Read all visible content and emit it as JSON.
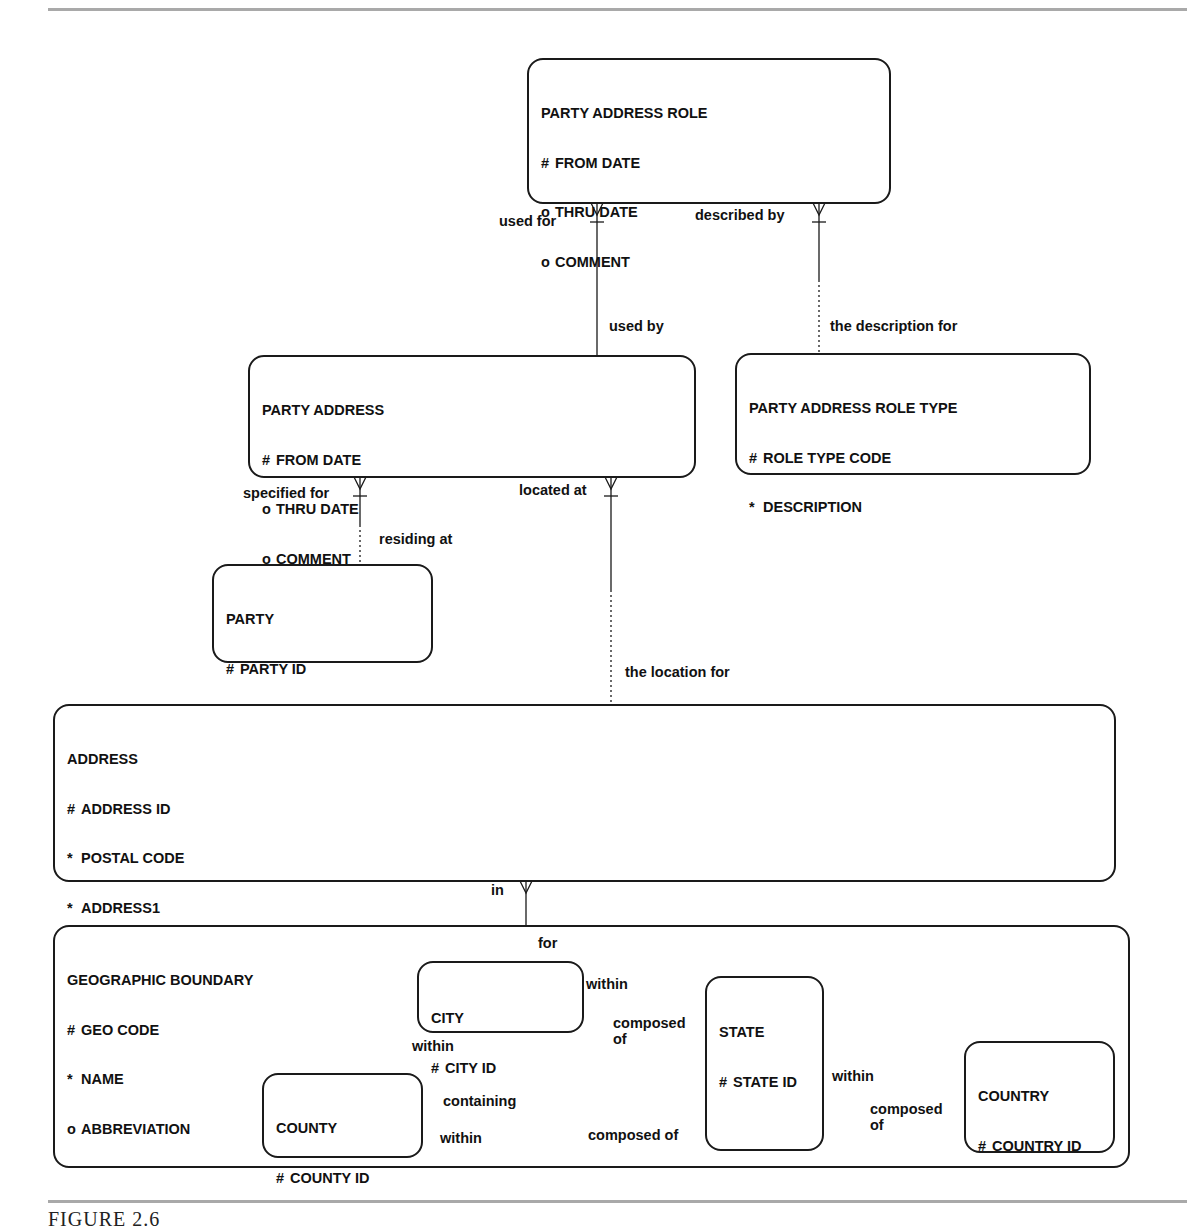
{
  "figure": {
    "caption": "FIGURE 2.6",
    "line_color": "#1a1a1a",
    "rule_color": "#a9a9a9"
  },
  "entities": {
    "party_address_role": {
      "name": "PARTY ADDRESS ROLE",
      "attributes": [
        {
          "symbol": "#",
          "label": "FROM DATE"
        },
        {
          "symbol": "o",
          "label": "THRU DATE"
        },
        {
          "symbol": "o",
          "label": "COMMENT"
        }
      ]
    },
    "party_address": {
      "name": "PARTY ADDRESS",
      "attributes": [
        {
          "symbol": "#",
          "label": "FROM DATE"
        },
        {
          "symbol": "o",
          "label": "THRU DATE"
        },
        {
          "symbol": "o",
          "label": "COMMENT"
        }
      ]
    },
    "party_address_role_type": {
      "name": "PARTY ADDRESS ROLE TYPE",
      "attributes": [
        {
          "symbol": "#",
          "label": "ROLE TYPE CODE"
        },
        {
          "symbol": "*",
          "label": "DESCRIPTION"
        }
      ]
    },
    "party": {
      "name": "PARTY",
      "attributes": [
        {
          "symbol": "#",
          "label": "PARTY ID"
        },
        {
          "symbol": "o",
          "label": "CREDIT RATING"
        }
      ]
    },
    "address": {
      "name": "ADDRESS",
      "attributes": [
        {
          "symbol": "#",
          "label": "ADDRESS ID"
        },
        {
          "symbol": "*",
          "label": "POSTAL CODE"
        },
        {
          "symbol": "*",
          "label": "ADDRESS1"
        },
        {
          "symbol": "o",
          "label": "ADDRESS2"
        },
        {
          "symbol": "o",
          "label": "DIRECTIONS"
        }
      ]
    },
    "geographic_boundary": {
      "name": "GEOGRAPHIC BOUNDARY",
      "attributes": [
        {
          "symbol": "#",
          "label": "GEO CODE"
        },
        {
          "symbol": "*",
          "label": "NAME"
        },
        {
          "symbol": "o",
          "label": "ABBREVIATION"
        }
      ]
    },
    "city": {
      "name": "CITY",
      "attributes": [
        {
          "symbol": "#",
          "label": "CITY ID"
        }
      ]
    },
    "state": {
      "name": "STATE",
      "attributes": [
        {
          "symbol": "#",
          "label": "STATE ID"
        }
      ]
    },
    "county": {
      "name": "COUNTY",
      "attributes": [
        {
          "symbol": "#",
          "label": "COUNTY ID"
        }
      ]
    },
    "country": {
      "name": "COUNTRY",
      "attributes": [
        {
          "symbol": "#",
          "label": "COUNTRY ID"
        }
      ]
    }
  },
  "relationships": {
    "role_party_address": {
      "from_label": "used for",
      "to_label": "used by"
    },
    "role_role_type": {
      "from_label": "described by",
      "to_label": "the description for"
    },
    "party_address_party": {
      "from_label": "specified for",
      "to_label": "residing at"
    },
    "party_address_address": {
      "from_label": "located at",
      "to_label": "the location for"
    },
    "address_geo": {
      "from_label": "in",
      "to_label": "for"
    },
    "city_state": {
      "from_label": "within",
      "to_label": "composed of"
    },
    "city_county": {
      "from_label": "within",
      "to_label": "containing"
    },
    "county_state": {
      "from_label": "within",
      "to_label": "composed of"
    },
    "state_country": {
      "from_label": "within",
      "to_label": "composed of"
    }
  }
}
